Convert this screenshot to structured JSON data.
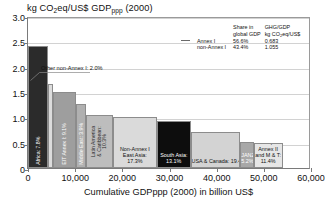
{
  "chart_data": {
    "type": "bar",
    "title": "kg CO2eq/US$ GDPppp (2000)",
    "title_main": "kg CO",
    "title_sub1": "2",
    "title_mid": "eq/US$ GDP",
    "title_sub2": "ppp",
    "title_tail": " (2000)",
    "xlabel": "Cumulative GDPppp (2000) in billion US$",
    "ylabel": "kg CO2eq/US$ GDPppp (2000)",
    "xlim": [
      0,
      60000
    ],
    "ylim": [
      0,
      3.0
    ],
    "grid": true,
    "grid_axis": "y",
    "legend_position": "top-right-inside",
    "note": "Bar widths represent share of global GDPppp; bar heights represent greenhouse gas emission intensity (kg CO2eq per US$ of GDPppp).",
    "xticks": [
      "0",
      "10,000",
      "20,000",
      "30,000",
      "40,000",
      "50,000",
      "60,000"
    ],
    "xtick_values": [
      0,
      10000,
      20000,
      30000,
      40000,
      50000,
      60000
    ],
    "yticks": [
      "0",
      "0.5",
      "1.0",
      "1.5",
      "2.0",
      "2.5",
      "3.0"
    ],
    "ytick_values": [
      0,
      0.5,
      1.0,
      1.5,
      2.0,
      2.5,
      3.0
    ],
    "categories": [
      "Africa",
      "Other non-Annex I",
      "EIT Annex I",
      "Middle East",
      "Latin America & Caribbean",
      "Non-Annex I East Asia",
      "South Asia",
      "USA & Canada",
      "JANZ",
      "Europe Annex II and M & T"
    ],
    "values": [
      2.4,
      1.65,
      1.5,
      1.26,
      1.05,
      1.01,
      0.92,
      0.72,
      0.52,
      0.5
    ],
    "widths_pct": [
      7.8,
      2.0,
      9.1,
      3.9,
      10.3,
      17.3,
      13.1,
      19.4,
      5.2,
      11.4
    ],
    "bars": [
      {
        "name": "Africa",
        "label": "Africa: 7.8%",
        "share_pct": 7.8,
        "intensity": 2.4,
        "x_start": 0,
        "x_end": 2100,
        "color": "#2b2b2b",
        "label_color": "#ffffff",
        "label_orientation": "vertical"
      },
      {
        "name": "Other non-Annex I",
        "label": "Other non-Annex I: 2.0%",
        "share_pct": 2.0,
        "intensity": 1.65,
        "x_start": 2100,
        "x_end": 2640,
        "color": "#dcdcdc",
        "label_color": "#111111",
        "label_orientation": "callout"
      },
      {
        "name": "EIT Annex I",
        "label": "EIT Annex I: 9.1%",
        "share_pct": 9.1,
        "intensity": 1.5,
        "x_start": 2640,
        "x_end": 5090,
        "color": "#9e9e9e",
        "label_color": "#ffffff",
        "label_orientation": "vertical"
      },
      {
        "name": "Middle East",
        "label": "Middle East: 3.9%",
        "share_pct": 3.9,
        "intensity": 1.26,
        "x_start": 5090,
        "x_end": 6140,
        "color": "#b0b0b0",
        "label_color": "#ffffff",
        "label_orientation": "vertical"
      },
      {
        "name": "Latin America & Caribbean",
        "label": "Latin America\n& Caribbean:\n10.3%",
        "share_pct": 10.3,
        "intensity": 1.05,
        "x_start": 6140,
        "x_end": 8910,
        "color": "#bdbdbd",
        "label_color": "#2b2b2b",
        "label_orientation": "vertical"
      },
      {
        "name": "Non-Annex I East Asia",
        "label": "Non-Annex I\nEast Asia:\n17.3%",
        "share_pct": 17.3,
        "intensity": 1.01,
        "x_start": 8910,
        "x_end": 13560,
        "color": "#dadada",
        "label_color": "#111111",
        "label_orientation": "horizontal"
      },
      {
        "name": "South Asia",
        "label": "South Asia:\n13.1%",
        "share_pct": 13.1,
        "intensity": 0.92,
        "x_start": 19370,
        "x_end": 22890,
        "color": "#0d0d0d",
        "label_color": "#ffffff",
        "label_orientation": "horizontal"
      },
      {
        "name": "USA & Canada",
        "label": "USA & Canada: 19.4%",
        "share_pct": 19.4,
        "intensity": 0.72,
        "x_start": 22890,
        "x_end": 28110,
        "color": "#d3d3d3",
        "label_color": "#111111",
        "label_orientation": "horizontal"
      },
      {
        "name": "JANZ",
        "label": "JANZ:\n5.2%",
        "share_pct": 5.2,
        "intensity": 0.52,
        "x_start": 38100,
        "x_end": 39500,
        "color": "#a8a8a8",
        "label_color": "#ffffff",
        "label_orientation": "horizontal"
      },
      {
        "name": "Europe Annex II and M & T",
        "label": "Europe Annex II\nand M & T:\n11.4%",
        "share_pct": 11.4,
        "intensity": 0.5,
        "x_start": 39500,
        "x_end": 42560,
        "color": "#e6e6e6",
        "label_color": "#111111",
        "label_orientation": "horizontal"
      }
    ],
    "annotations": [
      {
        "name": "other-non-annex-callout",
        "text": "Other non-Annex I: 2.0%",
        "points_to": "Other non-Annex I"
      }
    ],
    "legend_table": {
      "col_headers": [
        {
          "line1": "Share in",
          "line2": "global GDP"
        },
        {
          "line1": "GHG/GDP",
          "line2": "kg CO2eq/US$"
        }
      ],
      "header_share_l1": "Share in",
      "header_share_l2": "global GDP",
      "header_ghg_l1": "GHG/GDP",
      "header_ghg_l2_pre": "kg CO",
      "header_ghg_l2_sub": "2",
      "header_ghg_l2_post": "eq/US$",
      "rows": [
        {
          "name": "Annex I",
          "share_in_global_gdp": "56.6%",
          "ghg_per_gdp": "0.683"
        },
        {
          "name": "non-Annex I",
          "share_in_global_gdp": "43.4%",
          "ghg_per_gdp": "1.055"
        }
      ]
    },
    "colors": {
      "africa": "#2b2b2b",
      "other_non_annex_i": "#dcdcdc",
      "eit_annex_i": "#9e9e9e",
      "middle_east": "#b0b0b0",
      "latin_america_caribbean": "#bdbdbd",
      "non_annex_i_east_asia": "#dadada",
      "south_asia": "#0d0d0d",
      "usa_canada": "#d3d3d3",
      "janz": "#a8a8a8",
      "europe_annex_ii_mt": "#e6e6e6",
      "axis": "#7a7a7a",
      "gridline": "#d2d2d2",
      "text": "#111111",
      "background": "#ffffff"
    }
  }
}
